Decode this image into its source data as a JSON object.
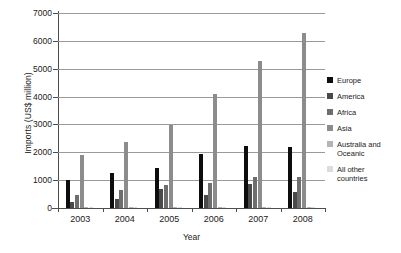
{
  "chart_data": {
    "type": "bar",
    "title": "",
    "xlabel": "Year",
    "ylabel": "Imports (US$ million)",
    "categories": [
      "2003",
      "2004",
      "2005",
      "2006",
      "2007",
      "2008"
    ],
    "ylim": [
      0,
      7000
    ],
    "yticks": [
      0,
      1000,
      2000,
      3000,
      4000,
      5000,
      6000,
      7000
    ],
    "ytick_labels": [
      "0",
      "1000",
      "2000",
      "3000",
      "4000",
      "5000",
      "6000",
      "7000"
    ],
    "grid": true,
    "legend_position": "right",
    "series": [
      {
        "name": "Europe",
        "color": "#0d0d0d",
        "values": [
          1000,
          1240,
          1420,
          1930,
          2230,
          2190
        ]
      },
      {
        "name": "America",
        "color": "#4a4a4a",
        "values": [
          215,
          310,
          700,
          455,
          855,
          580
        ]
      },
      {
        "name": "Africa",
        "color": "#6e6e6e",
        "values": [
          470,
          655,
          830,
          890,
          1130,
          1130
        ]
      },
      {
        "name": "Asia",
        "color": "#8c8c8c",
        "values": [
          1900,
          2370,
          2980,
          4090,
          5290,
          6280
        ]
      },
      {
        "name": "Australia and\nOceanic",
        "color": "#b5b5b5",
        "values": [
          18,
          20,
          22,
          25,
          30,
          32
        ]
      },
      {
        "name": "All other\ncountries",
        "color": "#dcdcdc",
        "values": [
          10,
          12,
          13,
          15,
          17,
          18
        ]
      }
    ]
  },
  "legend": {
    "items": [
      {
        "label": "Europe",
        "color": "#0d0d0d"
      },
      {
        "label": "America",
        "color": "#4a4a4a"
      },
      {
        "label": "Africa",
        "color": "#6e6e6e"
      },
      {
        "label": "Asia",
        "color": "#8c8c8c"
      },
      {
        "label": "Australia and\nOceanic",
        "color": "#b5b5b5"
      },
      {
        "label": "All other\ncountries",
        "color": "#dcdcdc"
      }
    ]
  },
  "axes": {
    "y_title": "Imports (US$ million)",
    "x_title": "Year"
  }
}
